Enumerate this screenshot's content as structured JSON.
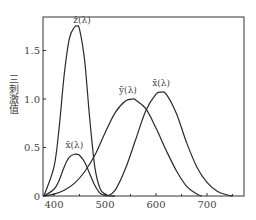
{
  "chart_data": {
    "type": "line",
    "title": "",
    "xlabel": "",
    "ylabel": "三刺激值",
    "xlim": [
      380,
      770
    ],
    "ylim": [
      0,
      1.85
    ],
    "x_ticks": [
      400,
      500,
      600,
      700
    ],
    "x_minor_ticks": [
      450,
      550,
      650,
      750
    ],
    "y_ticks": [
      0,
      0.5,
      1.0,
      1.5
    ],
    "y_tick_labels": [
      "0",
      "0.5",
      "1.0",
      "1.5"
    ],
    "x_tick_labels": [
      "400",
      "500",
      "600",
      "700"
    ],
    "grid": false,
    "legend": "inline labels",
    "series": [
      {
        "name": "z̄(λ)",
        "label": "z̄(λ)",
        "x": [
          380,
          400,
          410,
          420,
          430,
          440,
          445,
          450,
          460,
          470,
          480,
          490,
          500,
          510,
          520
        ],
        "values": [
          0.0,
          0.3,
          0.7,
          1.25,
          1.62,
          1.74,
          1.75,
          1.72,
          1.4,
          0.8,
          0.3,
          0.08,
          0.02,
          0.0,
          0.0
        ]
      },
      {
        "name": "x̄(λ) blue lobe",
        "label": "x̄(λ)",
        "x": [
          380,
          400,
          410,
          420,
          430,
          440,
          445,
          450,
          460,
          470,
          480,
          490,
          500,
          505
        ],
        "values": [
          0.0,
          0.07,
          0.16,
          0.3,
          0.4,
          0.43,
          0.43,
          0.42,
          0.35,
          0.23,
          0.11,
          0.03,
          0.005,
          0.0
        ]
      },
      {
        "name": "ȳ(λ)",
        "label": "ȳ(λ)",
        "x": [
          380,
          400,
          420,
          440,
          460,
          480,
          500,
          520,
          540,
          555,
          560,
          580,
          600,
          620,
          640,
          660,
          680,
          690
        ],
        "values": [
          0.0,
          0.02,
          0.06,
          0.13,
          0.25,
          0.42,
          0.65,
          0.86,
          0.98,
          1.0,
          0.99,
          0.9,
          0.7,
          0.47,
          0.26,
          0.1,
          0.02,
          0.0
        ]
      },
      {
        "name": "x̄(λ) red lobe",
        "label": "x̄(λ)",
        "x": [
          505,
          520,
          540,
          560,
          580,
          600,
          610,
          620,
          640,
          660,
          680,
          700,
          720,
          740,
          750
        ],
        "values": [
          0.0,
          0.06,
          0.28,
          0.58,
          0.88,
          1.05,
          1.07,
          1.05,
          0.85,
          0.55,
          0.3,
          0.14,
          0.05,
          0.01,
          0.0
        ]
      }
    ],
    "annotations": [
      {
        "text": "z̄(λ)",
        "x": 455,
        "y": 1.78
      },
      {
        "text": "x̄(λ)",
        "x": 440,
        "y": 0.5
      },
      {
        "text": "ȳ(λ)",
        "x": 545,
        "y": 1.06
      },
      {
        "text": "x̄(λ)",
        "x": 610,
        "y": 1.13
      }
    ]
  },
  "axis": {
    "ylabel": "三刺激值"
  }
}
